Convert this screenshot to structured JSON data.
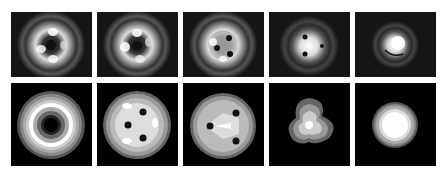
{
  "figure": {
    "rows": [
      {
        "name": "measured-intensity-row",
        "panels": [
          {
            "id": "top-1",
            "pattern": "ring with dark center and multiple lobes"
          },
          {
            "id": "top-2",
            "pattern": "ring with dark center, four lobes"
          },
          {
            "id": "top-3",
            "pattern": "three-lobe ring with dark spots"
          },
          {
            "id": "top-4",
            "pattern": "bright center with three dark spots"
          },
          {
            "id": "top-5",
            "pattern": "compact bright spot with swirl"
          }
        ]
      },
      {
        "name": "simulated-contour-row",
        "panels": [
          {
            "id": "bottom-1",
            "pattern": "donut with central dark core"
          },
          {
            "id": "bottom-2",
            "pattern": "disc with three dark vortices near center"
          },
          {
            "id": "bottom-3",
            "pattern": "disc with three dark vortices moving outward"
          },
          {
            "id": "bottom-4",
            "pattern": "trefoil-shaped bright spot"
          },
          {
            "id": "bottom-5",
            "pattern": "round bright Gaussian-like spot"
          }
        ]
      }
    ],
    "colors": {
      "background": "#ffffff",
      "panel": "#0a0a0a",
      "bright": "#ffffff"
    }
  }
}
